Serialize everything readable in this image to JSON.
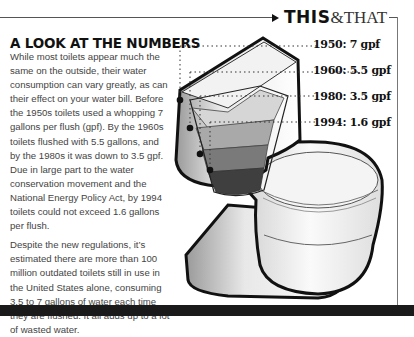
{
  "header": {
    "brand_bold": "THIS",
    "brand_light": "&THAT"
  },
  "article": {
    "title": "A LOOK AT THE NUMBERS",
    "paragraphs": [
      "While most toilets appear much the same on the outside, their water consumption can vary greatly, as can their effect on your water bill. Before the 1950s toilets used a whopping 7 gallons per flush (gpf). By the 1960s toilets flushed with 5.5 gallons, and by the 1980s it was down to 3.5 gpf. Due in large part to the water conservation movement and the National Energy Policy Act, by 1994 toilets could not exceed 1.6 gallons per flush.",
      "Despite the new regulations, it’s estimated there are more than 100 million outdated toilets still in use in the United States alone, consuming 3.5 to 7 gallons of water each time they are flushed. It all adds up to a lot of wasted water."
    ]
  },
  "illustration": {
    "subject": "toilet-cutaway-tank-water-levels",
    "levels": [
      {
        "label": "1950: 7 gpf",
        "year": 1950,
        "gpf": 7,
        "fill": "#d6d6d6"
      },
      {
        "label": "1960: 5.5 gpf",
        "year": 1960,
        "gpf": 5.5,
        "fill": "#a9a9a9"
      },
      {
        "label": "1980: 3.5 gpf",
        "year": 1980,
        "gpf": 3.5,
        "fill": "#7a7a7a"
      },
      {
        "label": "1994: 1.6 gpf",
        "year": 1994,
        "gpf": 1.6,
        "fill": "#3f3f3f"
      }
    ]
  }
}
